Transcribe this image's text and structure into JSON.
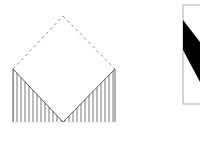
{
  "diagram": {
    "left_figure": {
      "description": "dashed square rotated 45 degrees with two vertically hatched triangles at the bottom",
      "apex": [
        63,
        16
      ],
      "left_corner": [
        13,
        69
      ],
      "right_corner": [
        115,
        69
      ],
      "bottom_vertex": [
        63,
        122
      ],
      "base_y": 122,
      "hatch_color": "#555555",
      "dash_color": "#777777"
    },
    "right_figure": {
      "description": "rectangle frame with black diagonal band",
      "frame": {
        "x": 183,
        "y": 5,
        "w": 40,
        "h": 99
      },
      "frame_color": "#999999",
      "band_color": "#000000"
    }
  }
}
